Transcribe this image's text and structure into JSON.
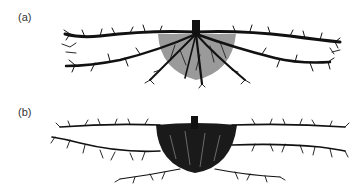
{
  "figure": {
    "panels": [
      {
        "label": "(a)",
        "description": "Root system with shallow lateral roots and grey-shaded central root zone"
      },
      {
        "label": "(b)",
        "description": "Root system with dense, darkly filled central root mass and fine lateral roots"
      }
    ],
    "colors": {
      "root": "#111111",
      "zone_a": "#9a9a9a",
      "zone_b": "#1a1a1a",
      "background": "#ffffff",
      "label": "#333333"
    }
  }
}
